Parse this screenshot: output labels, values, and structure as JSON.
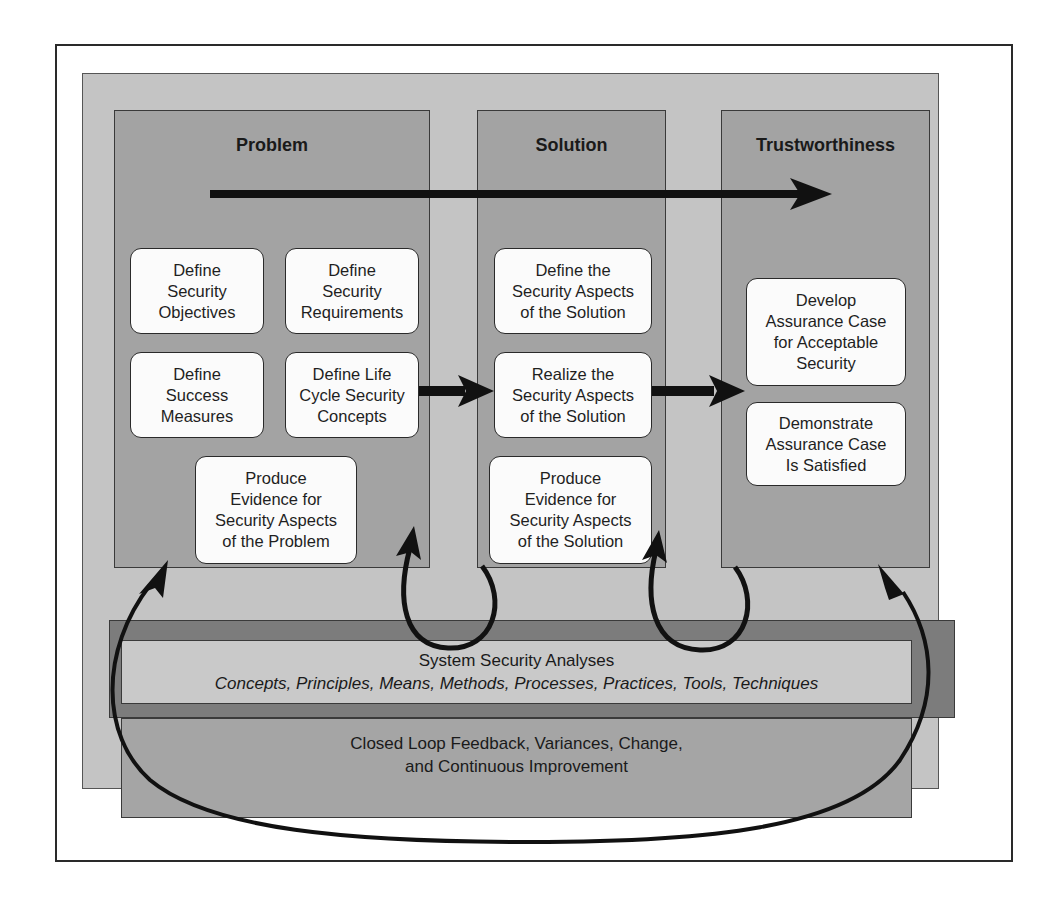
{
  "diagram": {
    "panels": [
      {
        "title": "Problem",
        "boxes": [
          {
            "label": "Define\nSecurity\nObjectives"
          },
          {
            "label": "Define\nSecurity\nRequirements"
          },
          {
            "label": "Define\nSuccess\nMeasures"
          },
          {
            "label": "Define Life\nCycle Security\nConcepts"
          },
          {
            "label": "Produce\nEvidence for\nSecurity Aspects\nof the Problem"
          }
        ]
      },
      {
        "title": "Solution",
        "boxes": [
          {
            "label": "Define the\nSecurity Aspects\nof the Solution"
          },
          {
            "label": "Realize the\nSecurity Aspects\nof the Solution"
          },
          {
            "label": "Produce\nEvidence for\nSecurity Aspects\nof the Solution"
          }
        ]
      },
      {
        "title": "Trustworthiness",
        "boxes": [
          {
            "label": "Develop\nAssurance Case\nfor Acceptable\nSecurity"
          },
          {
            "label": "Demonstrate\nAssurance Case\nIs Satisfied"
          }
        ]
      }
    ],
    "analysis": {
      "title": "System Security Analyses",
      "subtitle": "Concepts, Principles, Means, Methods, Processes, Practices, Tools, Techniques"
    },
    "feedback": {
      "label": "Closed Loop Feedback, Variances, Change,\nand Continuous Improvement"
    },
    "arrows": [
      {
        "from": "Problem",
        "to": "Trustworthiness",
        "kind": "overall-flow"
      },
      {
        "from": "Define Life Cycle Security Concepts",
        "to": "Realize the Security Aspects of the Solution"
      },
      {
        "from": "Realize the Security Aspects of the Solution",
        "to": "Develop Assurance Case for Acceptable Security"
      },
      {
        "from": "Solution",
        "to": "Problem",
        "kind": "feedback-loop"
      },
      {
        "from": "Trustworthiness",
        "to": "Solution",
        "kind": "feedback-loop"
      },
      {
        "from": "Problem",
        "to": "Trustworthiness",
        "kind": "closed-loop-ellipse"
      }
    ],
    "colors": {
      "frame_bg": "#ffffff",
      "outer_bg": "#c4c4c4",
      "panel_bg": "#a3a3a3",
      "box_bg": "#fbfbfb",
      "analysis_band": "#7c7c7c",
      "analysis_inner": "#c9c9c9",
      "feedback_bg": "#a5a5a5",
      "arrow": "#111111"
    }
  }
}
